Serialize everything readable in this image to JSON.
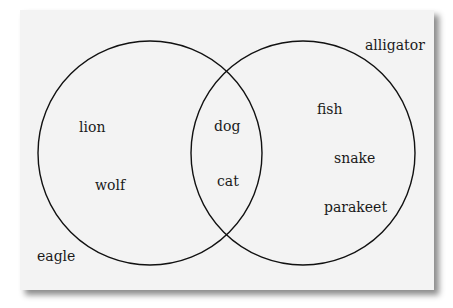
{
  "diagram": {
    "type": "venn",
    "sets": [
      {
        "name": "left-set",
        "members": [
          "lion",
          "wolf"
        ]
      },
      {
        "name": "right-set",
        "members": [
          "fish",
          "snake",
          "parakeet"
        ]
      }
    ],
    "intersection": [
      "dog",
      "cat"
    ],
    "outside": [
      "alligator",
      "eagle"
    ],
    "labels": {
      "lion": "lion",
      "wolf": "wolf",
      "dog": "dog",
      "cat": "cat",
      "fish": "fish",
      "snake": "snake",
      "parakeet": "parakeet",
      "alligator": "alligator",
      "eagle": "eagle"
    }
  }
}
